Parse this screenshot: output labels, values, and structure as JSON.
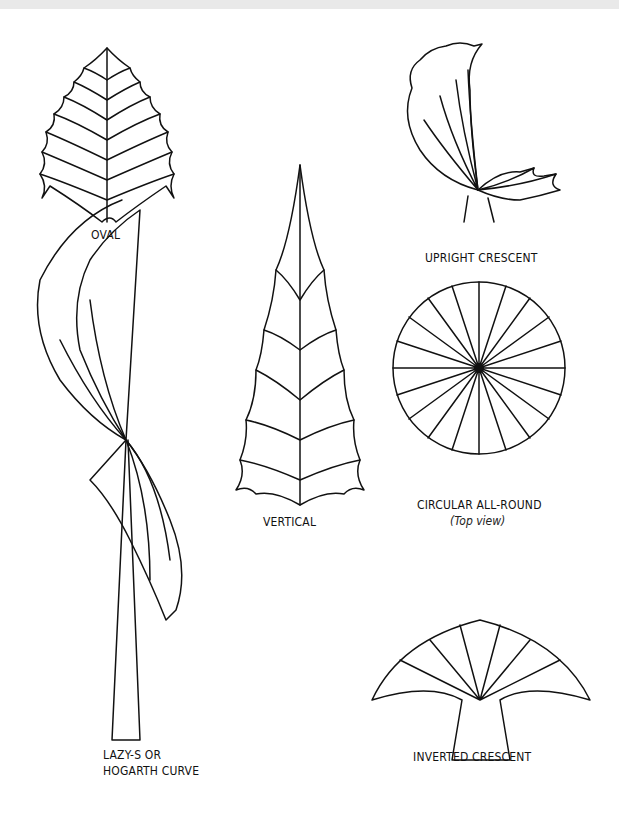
{
  "figure": {
    "labels": {
      "oval": "OVAL",
      "upright_crescent": "UPRIGHT CRESCENT",
      "vertical": "VERTICAL",
      "circular": "CIRCULAR ALL-ROUND",
      "circular_sub": "(Top view)",
      "lazy_s_line1": "LAZY-S OR",
      "lazy_s_line2": "HOGARTH CURVE",
      "inverted_crescent": "INVERTED CRESCENT"
    }
  }
}
